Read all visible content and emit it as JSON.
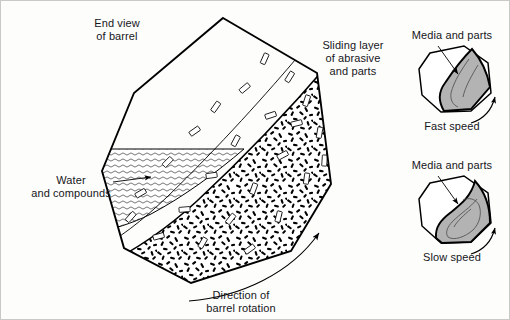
{
  "figure": {
    "background_color": "#fdfdfc",
    "line_color": "#000000",
    "media_fill_color": "#ffffff",
    "speckle_color": "#000000",
    "gray_mass_color": "#b3b3b3"
  },
  "labels": {
    "end_view": "End view\nof barrel",
    "sliding_layer": "Sliding layer\nof abrasive\nand parts",
    "water": "Water\nand compounds",
    "direction": "Direction of\nbarrel rotation",
    "media_and_parts_fast": "Media and parts",
    "fast_speed": "Fast speed",
    "media_and_parts_slow": "Media and parts",
    "slow_speed": "Slow speed"
  },
  "main_barrel": {
    "name": "end-view-of-barrel",
    "shape": "octagon",
    "outline_points": "222,17 316,72 330,183 290,250 190,282 123,247 101,170 133,92",
    "regions": [
      {
        "name": "water-and-compounds",
        "pattern": "wavy-horizontal-lines"
      },
      {
        "name": "abrasive-media-mass",
        "pattern": "dense-speckles-with-parts"
      },
      {
        "name": "sliding-layer",
        "pattern": "boundary-band"
      }
    ],
    "rotation_arrow": "counterclockwise-lower-right"
  },
  "speed_diagrams": [
    {
      "name": "fast-speed-barrel",
      "speed_label": "Fast speed",
      "media_label": "Media and parts",
      "mass_position": "diagonal-high",
      "rotation_arrow": "right-side-upward"
    },
    {
      "name": "slow-speed-barrel",
      "speed_label": "Slow speed",
      "media_label": "Media and parts",
      "mass_position": "low-s-curve",
      "rotation_arrow": "right-side-upward"
    }
  ]
}
